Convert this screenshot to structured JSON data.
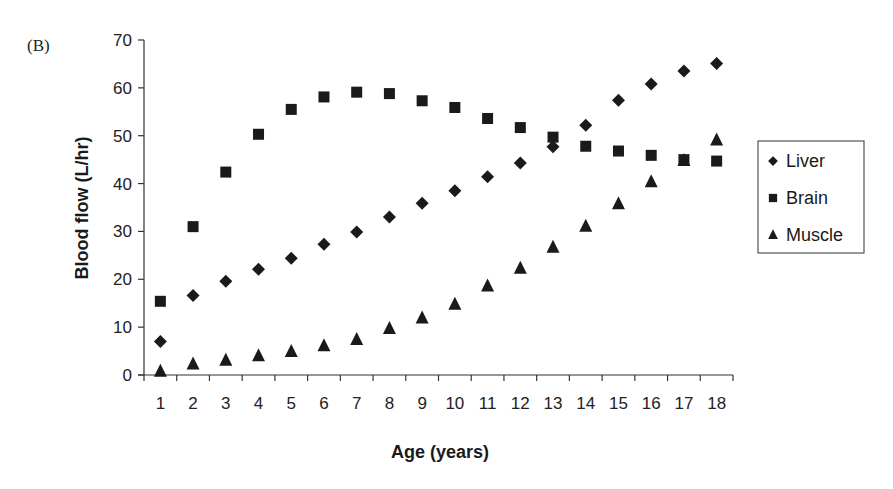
{
  "panel_label": "(B)",
  "chart_data": {
    "type": "scatter",
    "title": "",
    "xlabel": "Age (years)",
    "ylabel": "Blood flow (L/hr)",
    "ylim": [
      0,
      70
    ],
    "yticks": [
      0,
      10,
      20,
      30,
      40,
      50,
      60,
      70
    ],
    "categories": [
      "1",
      "2",
      "3",
      "4",
      "5",
      "6",
      "7",
      "8",
      "9",
      "10",
      "11",
      "12",
      "13",
      "14",
      "15",
      "16",
      "17",
      "18"
    ],
    "grid": false,
    "legend_position": "right",
    "series": [
      {
        "name": "Liver",
        "marker": "diamond",
        "values": [
          7.0,
          16.6,
          19.6,
          22.1,
          24.4,
          27.3,
          29.9,
          33.0,
          35.9,
          38.5,
          41.4,
          44.3,
          47.7,
          52.2,
          57.4,
          60.8,
          63.5,
          65.1
        ]
      },
      {
        "name": "Brain",
        "marker": "square",
        "values": [
          15.4,
          31.0,
          42.4,
          50.3,
          55.5,
          58.1,
          59.1,
          58.8,
          57.3,
          55.9,
          53.6,
          51.7,
          49.7,
          47.8,
          46.8,
          45.9,
          45.0,
          44.7
        ]
      },
      {
        "name": "Muscle",
        "marker": "triangle",
        "values": [
          0.8,
          2.3,
          3.1,
          4.0,
          4.9,
          6.1,
          7.4,
          9.7,
          11.9,
          14.8,
          18.6,
          22.3,
          26.7,
          31.1,
          35.8,
          40.4,
          44.8,
          49.1
        ]
      }
    ]
  },
  "legend": {
    "items": [
      {
        "label": "Liver",
        "marker": "diamond"
      },
      {
        "label": "Brain",
        "marker": "square"
      },
      {
        "label": "Muscle",
        "marker": "triangle"
      }
    ]
  },
  "colors": {
    "marker": "#1a1a1a",
    "axis": "#333333"
  }
}
